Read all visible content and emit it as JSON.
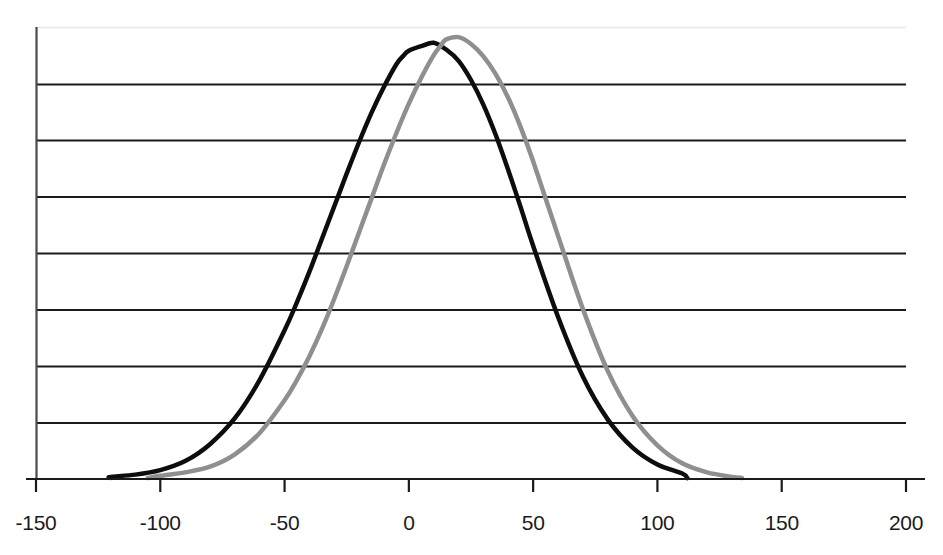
{
  "chart_data": {
    "type": "line",
    "title": "",
    "xlabel": "",
    "ylabel": "",
    "xlim": [
      -150,
      200
    ],
    "ylim": [
      0,
      8
    ],
    "grid": true,
    "gridlines_y": [
      1,
      2,
      3,
      4,
      5,
      6,
      7
    ],
    "legend_position": "none",
    "xticks": [
      -150,
      -100,
      -50,
      0,
      50,
      100,
      150,
      200
    ],
    "xtick_labels": [
      "-150",
      "-100",
      "-50",
      "0",
      "50",
      "100",
      "150",
      "200"
    ],
    "yticks": [
      0,
      1,
      2,
      3,
      4,
      5,
      6,
      7,
      8
    ],
    "ytick_labels": [
      "",
      "",
      "",
      "",
      "",
      "",
      "",
      "",
      ""
    ],
    "series": [
      {
        "name": "black-curve",
        "color": "#0d0d0d",
        "linewidth": 4.5,
        "distribution": "gaussian",
        "mean": -2,
        "sigma": 28,
        "peak": 7.72,
        "x_start": -120,
        "x_end": 112,
        "x": [
          -150,
          -140,
          -130,
          -120,
          -110,
          -100,
          -90,
          -80,
          -70,
          -60,
          -50,
          -45,
          -40,
          -35,
          -30,
          -25,
          -20,
          -15,
          -10,
          -5,
          -2,
          0,
          5,
          10,
          15,
          20,
          25,
          30,
          35,
          40,
          45,
          50,
          60,
          70,
          80,
          90,
          100,
          110,
          120,
          130,
          140,
          150,
          160,
          170,
          180,
          190,
          200
        ],
        "y": [
          0,
          0,
          0,
          0.02,
          0.06,
          0.14,
          0.3,
          0.6,
          1.06,
          1.74,
          2.62,
          3.12,
          3.66,
          4.24,
          4.82,
          5.4,
          5.96,
          6.48,
          6.94,
          7.34,
          7.5,
          7.58,
          7.66,
          7.72,
          7.6,
          7.4,
          7.06,
          6.62,
          6.08,
          5.46,
          4.8,
          4.12,
          2.86,
          1.8,
          1.04,
          0.54,
          0.24,
          0.08,
          0.02,
          0,
          0,
          0,
          0,
          0,
          0,
          0,
          0
        ]
      },
      {
        "name": "gray-curve",
        "color": "#8f8f8f",
        "linewidth": 4.5,
        "distribution": "gaussian",
        "mean": 13,
        "sigma": 28,
        "peak": 7.82,
        "x_start": -105,
        "x_end": 134,
        "x": [
          -150,
          -140,
          -130,
          -120,
          -110,
          -100,
          -90,
          -80,
          -70,
          -60,
          -50,
          -45,
          -40,
          -35,
          -30,
          -25,
          -20,
          -15,
          -10,
          -5,
          0,
          5,
          10,
          13,
          15,
          20,
          25,
          30,
          35,
          40,
          45,
          50,
          60,
          70,
          80,
          90,
          100,
          110,
          120,
          130,
          140,
          150,
          160,
          170,
          180,
          190,
          200
        ],
        "y": [
          0,
          0,
          0,
          0,
          0,
          0.04,
          0.1,
          0.2,
          0.42,
          0.8,
          1.38,
          1.74,
          2.16,
          2.64,
          3.18,
          3.76,
          4.36,
          4.96,
          5.56,
          6.12,
          6.64,
          7.1,
          7.5,
          7.68,
          7.78,
          7.82,
          7.7,
          7.48,
          7.16,
          6.74,
          6.22,
          5.62,
          4.3,
          3.0,
          1.9,
          1.1,
          0.58,
          0.26,
          0.1,
          0.02,
          0,
          0,
          0,
          0,
          0,
          0,
          0
        ]
      }
    ]
  },
  "axes": {
    "frame_color": "#1a1a1a",
    "top_border_color": "#e8e8e8",
    "gridline_color": "#1a1a1a",
    "background": "#ffffff"
  },
  "figure": {
    "title_remnant": ""
  }
}
